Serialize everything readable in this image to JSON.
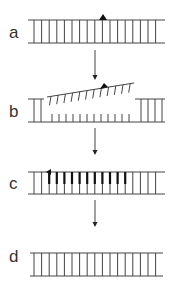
{
  "diagram": {
    "panels": [
      {
        "label": "a",
        "state": "intact duplex with lesion marker"
      },
      {
        "label": "b",
        "state": "strand displaced / excised segment"
      },
      {
        "label": "c",
        "state": "repair synthesis"
      },
      {
        "label": "d",
        "state": "restored duplex"
      }
    ],
    "colors": {
      "line": "#444444",
      "thick": "#222222",
      "background": "#ffffff"
    }
  }
}
